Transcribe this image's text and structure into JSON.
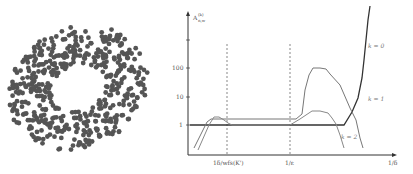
{
  "figure": {
    "left_panel": {
      "description": "scatter of points in an annulus (ring) shape",
      "point_color": "#555555"
    },
    "right_panel": {
      "y_axis_label": "A^(k)_{n,w}",
      "y_ticks": [
        "100",
        "10",
        "1"
      ],
      "x_ticks": [
        "1δ/wfs(K')",
        "1/ε",
        "1/δ"
      ],
      "curve_labels": [
        "k = 0",
        "k = 1",
        "k = 2"
      ]
    }
  },
  "chart_data": [
    {
      "type": "scatter",
      "title": "",
      "description": "Point cloud sampled from an annulus / torus-like ring",
      "xlabel": "",
      "ylabel": ""
    },
    {
      "type": "line",
      "title": "",
      "xlabel": "1/δ",
      "ylabel": "A^(k)_{n,w}",
      "y_scale": "log",
      "y_ticks": [
        1,
        10,
        100
      ],
      "x_ticks": [
        "1δ/wfs(K')",
        "1/ε",
        "1/δ"
      ],
      "grid": false,
      "vertical_dashed_lines_at": [
        "1δ/wfs(K')",
        "1/ε"
      ],
      "series": [
        {
          "name": "k = 0",
          "description": "flat at 1 across most of the range, then rises sharply to very large values at the right end"
        },
        {
          "name": "k = 1",
          "description": "slightly above 1 across middle, rises to a plateau near 100 after 1/ε, then falls off to the right"
        },
        {
          "name": "k = 2",
          "description": "small bump near the left, then near 1, then a bump just after 1/ε and falls off"
        }
      ]
    }
  ]
}
